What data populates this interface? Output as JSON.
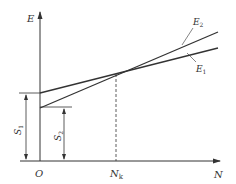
{
  "diagram": {
    "type": "break-even line diagram",
    "axes": {
      "y_label": "E",
      "x_label": "N",
      "origin_label": "O"
    },
    "lines": [
      {
        "id": "E2",
        "label": "E",
        "subscript": "2",
        "intercept_label": "S2",
        "description": "steeper line starting at lower intercept S2"
      },
      {
        "id": "E1",
        "label": "E",
        "subscript": "1",
        "intercept_label": "S1",
        "description": "shallower line starting at higher intercept S1"
      }
    ],
    "intersection": {
      "label": "N",
      "subscript": "k"
    },
    "dimensions": [
      {
        "id": "S1",
        "label": "S",
        "subscript": "1"
      },
      {
        "id": "S2",
        "label": "S",
        "subscript": "2"
      }
    ],
    "colors": {
      "line": "#333333",
      "background": "#ffffff"
    }
  }
}
